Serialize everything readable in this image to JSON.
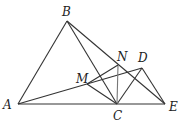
{
  "diagram": {
    "type": "geometry",
    "points": {
      "A": {
        "label": "A",
        "x": 18,
        "y": 104
      },
      "B": {
        "label": "B",
        "x": 67,
        "y": 21
      },
      "C": {
        "label": "C",
        "x": 117,
        "y": 104
      },
      "D": {
        "label": "D",
        "x": 142,
        "y": 68
      },
      "E": {
        "label": "E",
        "x": 165,
        "y": 104
      },
      "M": {
        "label": "M",
        "x": 87,
        "y": 84
      },
      "N": {
        "label": "N",
        "x": 118,
        "y": 65
      }
    },
    "segments": [
      "AB",
      "BC",
      "BE",
      "AE",
      "AD",
      "CD",
      "DE",
      "NC",
      "MN",
      "MC"
    ]
  }
}
